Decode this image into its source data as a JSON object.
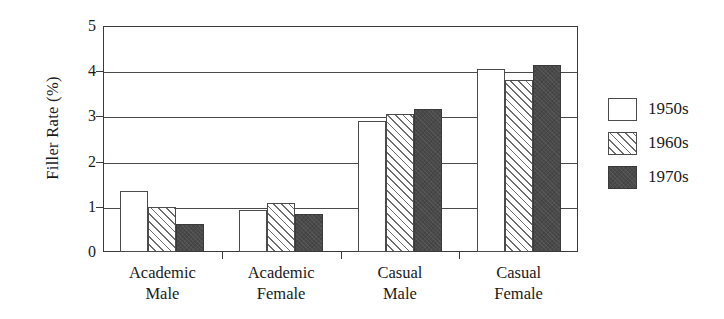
{
  "chart_data": {
    "type": "bar",
    "title": "",
    "subtitle": "",
    "xlabel": "",
    "ylabel": "Filler Rate (%)",
    "ylim": [
      0,
      5
    ],
    "yticks": [
      0,
      1,
      2,
      3,
      4,
      5
    ],
    "ytick_labels": [
      "0",
      "1",
      "2",
      "3",
      "4",
      "5"
    ],
    "grid": "horizontal",
    "legend_position": "right",
    "categories": [
      {
        "line1": "Academic",
        "line2": "Male"
      },
      {
        "line1": "Academic",
        "line2": "Female"
      },
      {
        "line1": "Casual",
        "line2": "Male"
      },
      {
        "line1": "Casual",
        "line2": "Female"
      }
    ],
    "category_labels": [
      "Academic Male",
      "Academic Female",
      "Casual Male",
      "Casual Female"
    ],
    "series": [
      {
        "name": "1950s",
        "fill": "white",
        "color": "#ffffff",
        "values": [
          1.34,
          0.93,
          2.89,
          4.04
        ]
      },
      {
        "name": "1960s",
        "fill": "diagonal-hatch",
        "color": "#6d6d6d",
        "values": [
          1.0,
          1.08,
          3.06,
          3.8
        ]
      },
      {
        "name": "1970s",
        "fill": "solid-dark-gray",
        "color": "#4a4a4a",
        "values": [
          0.63,
          0.84,
          3.16,
          4.14
        ]
      }
    ]
  },
  "legend": {
    "items": [
      {
        "label": "1950s",
        "style": "s1950"
      },
      {
        "label": "1960s",
        "style": "s1960"
      },
      {
        "label": "1970s",
        "style": "s1970"
      }
    ]
  },
  "axis": {
    "frame_color": "#3a3a3a",
    "gridline_color": "#4a4a4a"
  }
}
